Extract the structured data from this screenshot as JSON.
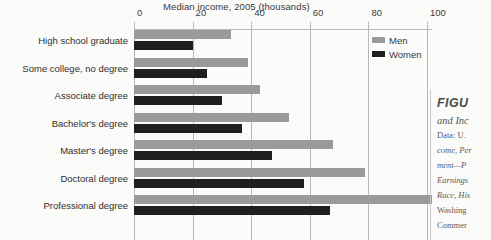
{
  "chart_data": {
    "type": "bar",
    "orientation": "horizontal",
    "title": "Median income, 2005 (thousands)",
    "xlabel": "",
    "ylabel": "",
    "xlim": [
      0,
      100
    ],
    "xticks": [
      0,
      20,
      40,
      60,
      80,
      100
    ],
    "grid": true,
    "legend_position": "top-right",
    "categories": [
      "High school graduate",
      "Some college, no degree",
      "Associate degree",
      "Bachelor's degree",
      "Master's degree",
      "Doctoral degree",
      "Professional degree"
    ],
    "series": [
      {
        "name": "Men",
        "color": "#9a9a9a",
        "values": [
          33,
          39,
          43,
          53,
          68,
          79,
          102
        ]
      },
      {
        "name": "Women",
        "color": "#1f1f1f",
        "values": [
          20,
          25,
          30,
          37,
          47,
          58,
          67
        ]
      }
    ]
  },
  "legend": {
    "items": [
      {
        "label": "Men"
      },
      {
        "label": "Women"
      }
    ]
  },
  "caption": {
    "figure_heading": "FIGU",
    "figure_subtitle": "and Inc",
    "source_lines": [
      "Data: U.",
      "come, Per",
      "ment—P",
      "Earnings",
      "Race, His",
      "Washing",
      "Commer"
    ]
  },
  "colors": {
    "men": "#9a9a9a",
    "women": "#1f1f1f",
    "grid": "#b9b9b7",
    "background": "#fbfbfa",
    "text": "#2f2f2f"
  }
}
